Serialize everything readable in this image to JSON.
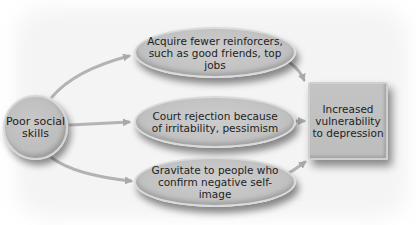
{
  "diagram": {
    "type": "flowchart",
    "source_node": {
      "id": "poor-social-skills",
      "shape": "circle",
      "label": "Poor social skills"
    },
    "intermediate_nodes": [
      {
        "id": "fewer-reinforcers",
        "shape": "ellipse",
        "label": "Acquire fewer reinforcers, such as good friends, top jobs"
      },
      {
        "id": "court-rejection",
        "shape": "ellipse",
        "label": "Court rejection because of irritability, pessimism"
      },
      {
        "id": "gravitate-negative",
        "shape": "ellipse",
        "label": "Gravitate to people who confirm negative self-image"
      }
    ],
    "target_node": {
      "id": "increased-vulnerability",
      "shape": "square",
      "label": "Increased vulnerability to depression"
    },
    "edges": [
      {
        "from": "poor-social-skills",
        "to": "fewer-reinforcers"
      },
      {
        "from": "poor-social-skills",
        "to": "court-rejection"
      },
      {
        "from": "poor-social-skills",
        "to": "gravitate-negative"
      },
      {
        "from": "fewer-reinforcers",
        "to": "increased-vulnerability"
      },
      {
        "from": "court-rejection",
        "to": "increased-vulnerability"
      },
      {
        "from": "gravitate-negative",
        "to": "increased-vulnerability"
      }
    ]
  },
  "colors": {
    "node_fill": "#c2c2c2",
    "node_border": "#d8d8d8",
    "arrow": "#a9a9a9",
    "text": "#1e1e1e",
    "background": "#f6f6f6"
  }
}
